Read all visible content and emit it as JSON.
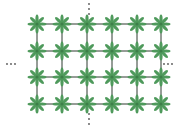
{
  "diagram": {
    "type": "repeating-lattice",
    "columns": 6,
    "rows": 4,
    "col_x": [
      37,
      62,
      87,
      112,
      137,
      161
    ],
    "row_y": [
      24,
      51,
      77,
      104
    ],
    "node": {
      "shape": "flower-8-petal",
      "petal_count": 8,
      "petal_length": 9,
      "petal_width": 3.2,
      "color": "#4f9a5c",
      "center_color": "#3d7f49"
    },
    "line_color": "#2f3a30",
    "line_width": 1,
    "continuation_marks": {
      "top": {
        "x": 89,
        "y": [
          4,
          9,
          14
        ],
        "orientation": "vertical"
      },
      "bottom": {
        "x": 89,
        "y": [
          114,
          119,
          124
        ],
        "orientation": "vertical"
      },
      "left": {
        "x": [
          7,
          11,
          15
        ],
        "y": 64,
        "orientation": "horizontal"
      },
      "right": {
        "x": [
          164,
          168,
          172
        ],
        "y": 64,
        "orientation": "horizontal"
      },
      "color": "#555555"
    }
  }
}
